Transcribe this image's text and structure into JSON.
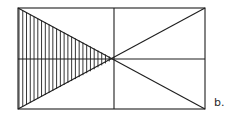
{
  "diagram": {
    "label": "b.",
    "stroke_color": "#1e1e1e",
    "hatch_color": "#1e1e1e",
    "background": "#ffffff",
    "rectangle": {
      "x1": 18,
      "y1": 8,
      "x2": 205,
      "y2": 109
    },
    "center": {
      "x": 114,
      "y": 59
    },
    "hatched_region": "left triangle formed by the two diagonals",
    "hatch_line_count": 25
  }
}
